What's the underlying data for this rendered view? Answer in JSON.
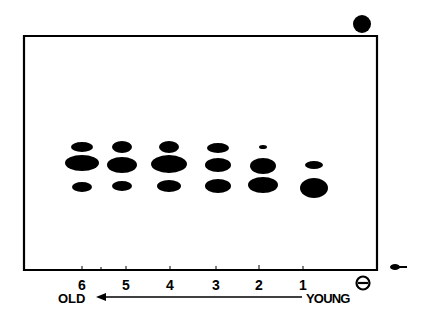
{
  "figure": {
    "type": "electrophoresis-gel",
    "lanes": [
      {
        "label": "6",
        "x": 82,
        "bands": [
          {
            "y": 147,
            "rx": 11,
            "ry": 5
          },
          {
            "y": 163,
            "rx": 17,
            "ry": 8
          },
          {
            "y": 187,
            "rx": 10,
            "ry": 5
          }
        ]
      },
      {
        "label": "5",
        "x": 122,
        "bands": [
          {
            "y": 147,
            "rx": 10,
            "ry": 6
          },
          {
            "y": 165,
            "rx": 15,
            "ry": 8
          },
          {
            "y": 186,
            "rx": 10,
            "ry": 5
          }
        ]
      },
      {
        "label": "4",
        "x": 169,
        "bands": [
          {
            "y": 147,
            "rx": 10,
            "ry": 6
          },
          {
            "y": 164,
            "rx": 18,
            "ry": 9
          },
          {
            "y": 186,
            "rx": 12,
            "ry": 6
          }
        ]
      },
      {
        "label": "3",
        "x": 218,
        "bands": [
          {
            "y": 148,
            "rx": 11,
            "ry": 5
          },
          {
            "y": 165,
            "rx": 13,
            "ry": 7
          },
          {
            "y": 186,
            "rx": 13,
            "ry": 7
          }
        ]
      },
      {
        "label": "2",
        "x": 263,
        "bands": [
          {
            "y": 147,
            "rx": 4,
            "ry": 2
          },
          {
            "y": 166,
            "rx": 13,
            "ry": 8
          },
          {
            "y": 185,
            "rx": 15,
            "ry": 8
          }
        ]
      },
      {
        "label": "1",
        "x": 314,
        "bands": [
          {
            "y": 165,
            "rx": 9,
            "ry": 4
          },
          {
            "y": 188,
            "rx": 14,
            "ry": 10
          }
        ]
      }
    ],
    "cathode_symbol": "⊖",
    "anode_marker": "filled-circle",
    "left_label": "OLD",
    "right_label": "YOUNG",
    "colors": {
      "ink": "#000000",
      "background": "#ffffff"
    }
  },
  "labels": {
    "lane_6": "6",
    "lane_5": "5",
    "lane_4": "4",
    "lane_3": "3",
    "lane_2": "2",
    "lane_1": "1",
    "old": "OLD",
    "young": "YOUNG"
  }
}
